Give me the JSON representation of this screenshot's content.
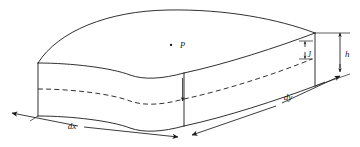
{
  "figure": {
    "type": "technical-line-diagram",
    "background_color": "#ffffff",
    "line_color": "#1a1a1a"
  },
  "labels": {
    "point_p": "P",
    "dim_dx": "dx",
    "dim_dy": "dy",
    "dim_h": "h",
    "dim_inner": "J"
  },
  "annotations": {
    "point_marker_name": "point-dot",
    "vertical_arrow_name": "center-vertical-arrow",
    "dx_arrow_name": "dx-dimension-arrow",
    "dy_arrow_name": "dy-dimension-arrow",
    "h_arrow_name": "h-dimension-arrow",
    "inner_arrow_name": "inner-dimension-arrow"
  },
  "geometry": {
    "top_surface": "doubly-curved upper face",
    "front_left_face": "curved vertical face along dx",
    "front_right_face": "curved vertical face along dy",
    "left_end_face": "flat quadrilateral end cap",
    "right_end_face": "flat quadrilateral end cap",
    "hidden_edge": "dashed interior contour line"
  }
}
